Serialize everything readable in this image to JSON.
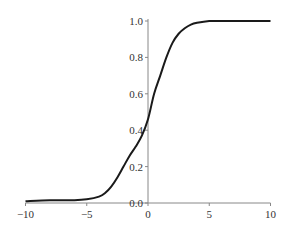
{
  "chart_data": {
    "type": "line",
    "title": "",
    "xlabel": "",
    "ylabel": "",
    "xlim": [
      -10,
      10
    ],
    "ylim": [
      0,
      1.0
    ],
    "grid": false,
    "legend": null,
    "x_ticks": [
      -10,
      -5,
      0,
      5,
      10
    ],
    "x_tick_labels": [
      "−10",
      "−5",
      "0",
      "5",
      "10"
    ],
    "y_ticks": [
      0.0,
      0.2,
      0.4,
      0.6,
      0.8,
      1.0
    ],
    "y_tick_labels": [
      "0.0",
      "0.2",
      "0.4",
      "0.6",
      "0.8",
      "1.0"
    ],
    "series": [
      {
        "name": "curve",
        "color": "#1a1a1a",
        "x": [
          -10,
          -8,
          -6,
          -5,
          -4,
          -3.5,
          -3,
          -2.5,
          -2,
          -1.5,
          -1,
          -0.5,
          0,
          0.5,
          1,
          1.5,
          2,
          2.5,
          3,
          3.5,
          4,
          5,
          6,
          8,
          10
        ],
        "y": [
          0.01,
          0.015,
          0.015,
          0.02,
          0.035,
          0.055,
          0.09,
          0.14,
          0.2,
          0.26,
          0.31,
          0.37,
          0.46,
          0.6,
          0.7,
          0.8,
          0.88,
          0.93,
          0.96,
          0.98,
          0.99,
          1.0,
          1.0,
          1.0,
          1.0
        ]
      }
    ]
  },
  "axes": {
    "origin_x_px": 148,
    "origin_y_px": 203,
    "px_per_x_unit": 12.25,
    "px_per_y_unit": 182,
    "axis_color": "#888888"
  }
}
